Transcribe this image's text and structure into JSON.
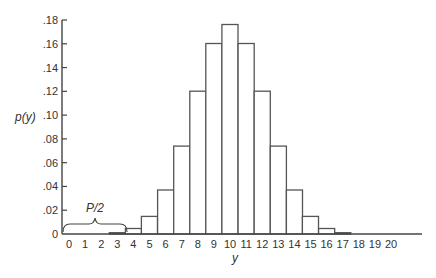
{
  "chart_data": {
    "type": "bar",
    "title": "",
    "xlabel": "y",
    "ylabel": "p(y)",
    "x": [
      0,
      1,
      2,
      3,
      4,
      5,
      6,
      7,
      8,
      9,
      10,
      11,
      12,
      13,
      14,
      15,
      16,
      17,
      18,
      19,
      20
    ],
    "categories": [
      "0",
      "1",
      "2",
      "3",
      "4",
      "5",
      "6",
      "7",
      "8",
      "9",
      "10",
      "11",
      "12",
      "13",
      "14",
      "15",
      "16",
      "17",
      "18",
      "19",
      "20"
    ],
    "values": [
      1e-06,
      2e-05,
      0.0002,
      0.0011,
      0.0046,
      0.0148,
      0.037,
      0.0739,
      0.1201,
      0.1602,
      0.1762,
      0.1602,
      0.1201,
      0.0739,
      0.037,
      0.0148,
      0.0046,
      0.0011,
      0.0002,
      2e-05,
      1e-06
    ],
    "ylim": [
      0,
      0.18
    ],
    "yticks": [
      0,
      0.02,
      0.04,
      0.06,
      0.08,
      0.1,
      0.12,
      0.14,
      0.16,
      0.18
    ],
    "ytick_labels": [
      "0",
      ".02",
      ".04",
      ".06",
      ".08",
      ".10",
      ".12",
      ".14",
      ".16",
      ".18"
    ],
    "grid": false,
    "legend": null,
    "annotations": [
      {
        "text": "P/2",
        "type": "brace",
        "span_x": [
          0,
          3.5
        ],
        "description": "brace over left tail y=0..3"
      }
    ]
  },
  "labels": {
    "ylabel": "p(y)",
    "xlabel": "y",
    "annotation": "P/2"
  }
}
